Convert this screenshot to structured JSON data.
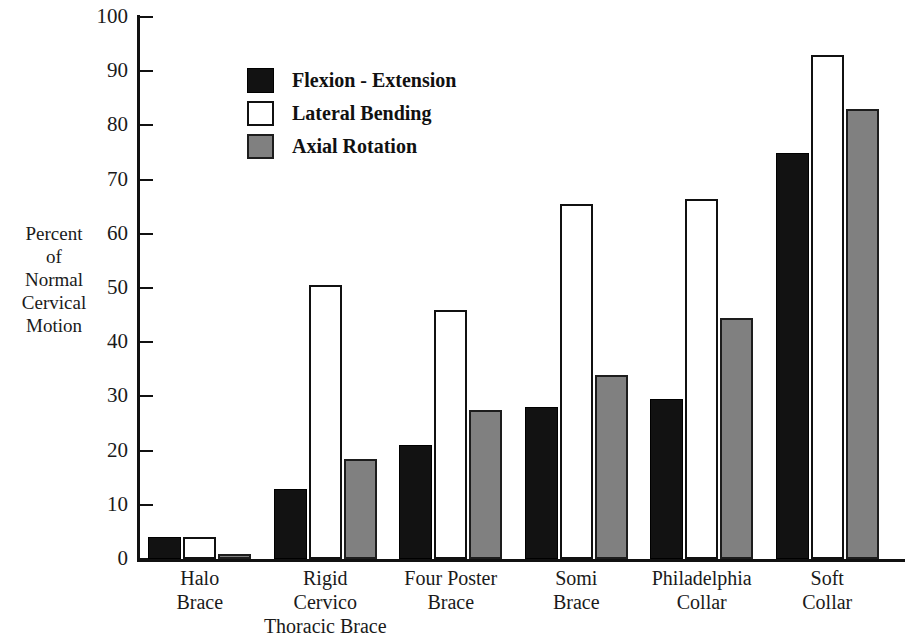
{
  "chart_data": {
    "type": "bar",
    "title": "",
    "xlabel": "",
    "ylabel": "Percent of Normal Cervical Motion",
    "ylabel_lines": [
      "Percent",
      "of",
      "Normal",
      "Cervical",
      "Motion"
    ],
    "ylim": [
      0,
      100
    ],
    "yticks": [
      0,
      10,
      20,
      30,
      40,
      50,
      60,
      70,
      80,
      90,
      100
    ],
    "ytick_labels": [
      "0",
      "10",
      "20",
      "30",
      "40",
      "50",
      "60",
      "70",
      "80",
      "90",
      "100"
    ],
    "grid": false,
    "legend_position": "upper-left-inside",
    "categories": [
      "Halo Brace",
      "Rigid Cervico Thoracic Brace",
      "Four Poster Brace",
      "Somi Brace",
      "Philadelphia Collar",
      "Soft Collar"
    ],
    "category_label_lines": [
      [
        "Halo",
        "Brace"
      ],
      [
        "Rigid",
        "Cervico",
        "Thoracic Brace"
      ],
      [
        "Four Poster",
        "Brace"
      ],
      [
        "Somi",
        "Brace"
      ],
      [
        "Philadelphia",
        "Collar"
      ],
      [
        "Soft",
        "Collar"
      ]
    ],
    "series": [
      {
        "name": "Flexion - Extension",
        "color": "#121212",
        "values": [
          4,
          13,
          21,
          28,
          29.5,
          75
        ]
      },
      {
        "name": "Lateral Bending",
        "color": "#ffffff",
        "values": [
          4,
          50.5,
          46,
          65.5,
          66.5,
          93
        ]
      },
      {
        "name": "Axial Rotation",
        "color": "#808080",
        "values": [
          1,
          18.5,
          27.5,
          34,
          44.5,
          83
        ]
      }
    ]
  }
}
